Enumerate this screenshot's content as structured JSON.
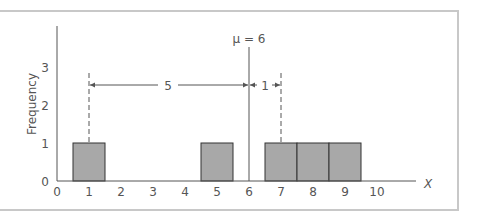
{
  "chart_data": {
    "type": "bar",
    "title": "",
    "xlabel": "X",
    "ylabel": "Frequency",
    "x_ticks": [
      "0",
      "1",
      "2",
      "3",
      "4",
      "5",
      "6",
      "7",
      "8",
      "9",
      "10"
    ],
    "y_ticks": [
      "0",
      "1",
      "2",
      "3"
    ],
    "categories": [
      1,
      5,
      7,
      8,
      9
    ],
    "values": [
      1,
      1,
      1,
      1,
      1
    ],
    "xlim": [
      0,
      10.5
    ],
    "ylim": [
      0,
      4
    ],
    "grid": false,
    "bar_color": "#a8a8a8",
    "bar_edge_color": "#333333",
    "annotations": {
      "mean_label": "μ = 6",
      "mean_value": 6,
      "left_distance_label": "5",
      "left_distance_from": 1,
      "right_distance_label": "1",
      "right_distance_to": 7
    }
  }
}
